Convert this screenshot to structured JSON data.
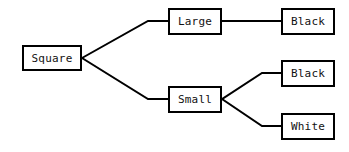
{
  "diagram": {
    "type": "tree",
    "background_color": "#ffffff",
    "line_color": "#000000",
    "box_border_color": "#000000",
    "box_fill_color": "#ffffff",
    "text_color": "#111111",
    "nodes": [
      {
        "id": "root",
        "label": "Square",
        "level": 0
      },
      {
        "id": "large",
        "label": "Large",
        "level": 1
      },
      {
        "id": "small",
        "label": "Small",
        "level": 1
      },
      {
        "id": "lblack",
        "label": "Black",
        "level": 2
      },
      {
        "id": "sblack",
        "label": "Black",
        "level": 2
      },
      {
        "id": "swhite",
        "label": "White",
        "level": 2
      }
    ],
    "edges": [
      {
        "from": "root",
        "to": "large"
      },
      {
        "from": "root",
        "to": "small"
      },
      {
        "from": "large",
        "to": "lblack"
      },
      {
        "from": "small",
        "to": "sblack"
      },
      {
        "from": "small",
        "to": "swhite"
      }
    ]
  }
}
